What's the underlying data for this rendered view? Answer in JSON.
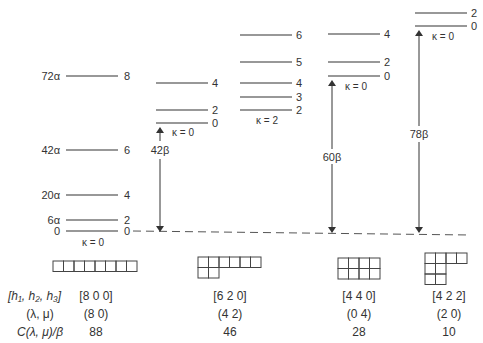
{
  "diagram": {
    "type": "energy-level-diagram",
    "columns": [
      {
        "id": "col-800",
        "levels": [
          {
            "L": "8",
            "energy_label": "72α"
          },
          {
            "L": "6",
            "energy_label": "42α"
          },
          {
            "L": "4",
            "energy_label": "20α"
          },
          {
            "L": "2",
            "energy_label": "6α"
          },
          {
            "L": "0",
            "energy_label": "0"
          }
        ],
        "kappa_label": "κ = 0",
        "young_diagram_rows": [
          8
        ],
        "h_label": "[8 0 0]",
        "lambda_mu": "(8 0)",
        "casimir": "88"
      },
      {
        "id": "col-620",
        "bands": [
          {
            "kappa_label": "κ = 0",
            "levels": [
              "4",
              "2",
              "0"
            ]
          },
          {
            "kappa_label": "κ = 2",
            "levels": [
              "6",
              "5",
              "4",
              "3",
              "2"
            ]
          }
        ],
        "arrow_label": "42β",
        "young_diagram_rows": [
          6,
          2
        ],
        "h_label": "[6 2 0]",
        "lambda_mu": "(4 2)",
        "casimir": "46"
      },
      {
        "id": "col-440",
        "levels": [
          "4",
          "2",
          "0"
        ],
        "kappa_label": "κ = 0",
        "arrow_label": "60β",
        "young_diagram_rows": [
          4,
          4
        ],
        "h_label": "[4 4 0]",
        "lambda_mu": "(0 4)",
        "casimir": "28"
      },
      {
        "id": "col-422",
        "levels": [
          "2",
          "0"
        ],
        "kappa_label": "κ = 0",
        "arrow_label": "78β",
        "young_diagram_rows": [
          4,
          2,
          2
        ],
        "h_label": "[4 2 2]",
        "lambda_mu": "(2 0)",
        "casimir": "10"
      }
    ],
    "row_labels": {
      "h": "[h₁, h₂, h₃]",
      "lambda_mu": "(λ, μ)",
      "casimir": "C(λ, μ)/β"
    }
  }
}
